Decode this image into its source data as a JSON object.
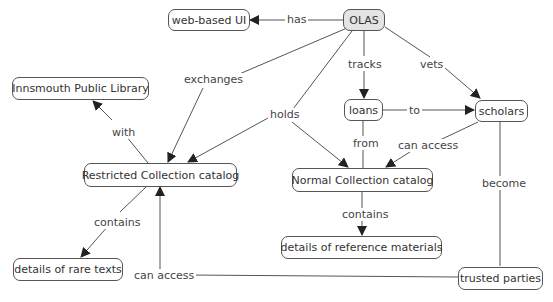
{
  "diagram": {
    "type": "concept-map",
    "colors": {
      "root_fill": "#e4e4e4",
      "node_fill": "#ffffff",
      "border": "#555555",
      "line": "#555555"
    },
    "nodes": {
      "olas": "OLAS",
      "web_ui": "web-based UI",
      "innsmouth": "Innsmouth Public Library",
      "restricted": "Restricted Collection catalog",
      "loans": "loans",
      "scholars": "scholars",
      "normal": "Normal Collection catalog",
      "rare_texts": "details of rare texts",
      "reference": "details of reference  materials",
      "trusted": "trusted parties"
    },
    "links": {
      "has": "has",
      "exchanges": "exchanges",
      "holds": "holds",
      "tracks": "tracks",
      "vets": "vets",
      "to": "to",
      "with": "with",
      "from": "from",
      "can_access_scholars": "can access",
      "become": "become",
      "contains_restricted": "contains",
      "contains_normal": "contains",
      "can_access_trusted": "can access"
    },
    "edges": [
      {
        "from": "OLAS",
        "label": "has",
        "to": "web-based UI"
      },
      {
        "from": "OLAS",
        "label": "exchanges",
        "to": "Restricted Collection catalog"
      },
      {
        "from": "OLAS",
        "label": "holds",
        "to": "Restricted Collection catalog"
      },
      {
        "from": "OLAS",
        "label": "holds",
        "to": "Normal Collection catalog"
      },
      {
        "from": "OLAS",
        "label": "tracks",
        "to": "loans"
      },
      {
        "from": "OLAS",
        "label": "vets",
        "to": "scholars"
      },
      {
        "from": "loans",
        "label": "to",
        "to": "scholars"
      },
      {
        "from": "loans",
        "label": "from",
        "to": "Normal Collection catalog"
      },
      {
        "from": "Restricted Collection catalog",
        "label": "with",
        "to": "Innsmouth Public Library"
      },
      {
        "from": "scholars",
        "label": "can access",
        "to": "Normal Collection catalog"
      },
      {
        "from": "scholars",
        "label": "become",
        "to": "trusted parties"
      },
      {
        "from": "Restricted Collection catalog",
        "label": "contains",
        "to": "details of rare texts"
      },
      {
        "from": "Normal Collection catalog",
        "label": "contains",
        "to": "details of reference  materials"
      },
      {
        "from": "trusted parties",
        "label": "can access",
        "to": "Restricted Collection catalog"
      }
    ]
  }
}
